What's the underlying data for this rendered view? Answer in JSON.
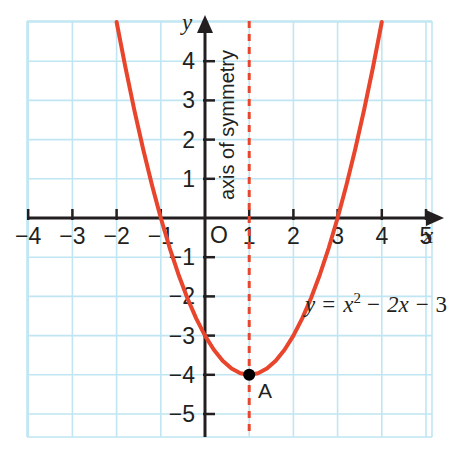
{
  "chart_data": {
    "type": "line",
    "title": "",
    "subtitle": "",
    "xlabel": "x",
    "ylabel": "y",
    "xlim": [
      -5.0,
      5.7
    ],
    "ylim": [
      -5.4,
      5.4
    ],
    "grid": true,
    "grid_step": 1,
    "legend": "none",
    "equation": "y = x² − 2x − 3",
    "equation_parts": {
      "lhs": "y",
      "equals": "=",
      "term1_base": "x",
      "term1_exp": "2",
      "minus1": "−",
      "term2": "2x",
      "minus2": "−",
      "term3": "3"
    },
    "curve": {
      "name": "y = x² − 2x − 3",
      "color": "#e8452c",
      "function": "x^2 - 2x - 3",
      "points": [
        {
          "x": -2.0,
          "y": 5.0
        },
        {
          "x": -1.8,
          "y": 3.84
        },
        {
          "x": -1.6,
          "y": 2.76
        },
        {
          "x": -1.4,
          "y": 1.76
        },
        {
          "x": -1.2,
          "y": 0.84
        },
        {
          "x": -1.0,
          "y": 0.0
        },
        {
          "x": -0.8,
          "y": -0.76
        },
        {
          "x": -0.6,
          "y": -1.44
        },
        {
          "x": -0.4,
          "y": -2.04
        },
        {
          "x": -0.2,
          "y": -2.56
        },
        {
          "x": 0.0,
          "y": -3.0
        },
        {
          "x": 0.2,
          "y": -3.36
        },
        {
          "x": 0.4,
          "y": -3.64
        },
        {
          "x": 0.6,
          "y": -3.84
        },
        {
          "x": 0.8,
          "y": -3.96
        },
        {
          "x": 1.0,
          "y": -4.0
        },
        {
          "x": 1.2,
          "y": -3.96
        },
        {
          "x": 1.4,
          "y": -3.84
        },
        {
          "x": 1.6,
          "y": -3.64
        },
        {
          "x": 1.8,
          "y": -3.36
        },
        {
          "x": 2.0,
          "y": -3.0
        },
        {
          "x": 2.2,
          "y": -2.56
        },
        {
          "x": 2.4,
          "y": -2.04
        },
        {
          "x": 2.6,
          "y": -1.44
        },
        {
          "x": 2.8,
          "y": -0.76
        },
        {
          "x": 3.0,
          "y": 0.0
        },
        {
          "x": 3.2,
          "y": 0.84
        },
        {
          "x": 3.4,
          "y": 1.76
        },
        {
          "x": 3.6,
          "y": 2.76
        },
        {
          "x": 3.8,
          "y": 3.84
        },
        {
          "x": 4.0,
          "y": 5.0
        }
      ]
    },
    "vertex": {
      "label": "A",
      "x": 1,
      "y": -4,
      "color": "#000000"
    },
    "axis_of_symmetry": {
      "label": "axis of symmetry",
      "x": 1,
      "style": "dashed",
      "color": "#e8452c"
    },
    "roots": [
      -1,
      3
    ],
    "y_intercept": -3,
    "x_ticks": [
      -4,
      -3,
      -2,
      -1,
      1,
      2,
      3,
      4,
      5
    ],
    "x_tick_labels": [
      "−4",
      "−3",
      "−2",
      "−1",
      "1",
      "2",
      "3",
      "4",
      "5"
    ],
    "y_ticks": [
      4,
      3,
      2,
      1,
      -1,
      -2,
      -3,
      -4,
      -5
    ],
    "y_tick_labels": [
      "4",
      "3",
      "2",
      "1",
      "−1",
      "−2",
      "−3",
      "−4",
      "−5"
    ],
    "origin_label": "O",
    "colors": {
      "curve": "#e8452c",
      "grid": "#bfe6f2",
      "axis": "#231f20",
      "text": "#231f20",
      "point": "#000000",
      "background": "#ffffff"
    }
  }
}
